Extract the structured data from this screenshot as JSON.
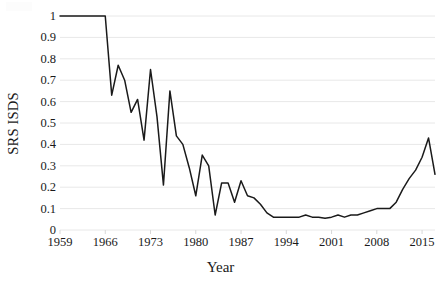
{
  "chart_data": {
    "type": "line",
    "title": "",
    "xlabel": "Year",
    "ylabel": "SRS ISDS",
    "xlim": [
      1959,
      2017
    ],
    "ylim": [
      0,
      1
    ],
    "grid": true,
    "legend": false,
    "line_color": "#1a1a1a",
    "gridline_color": "#e8e8e8",
    "ytick_labels": [
      "1",
      "0.9",
      "0.8",
      "0.7",
      "0.6",
      "0.5",
      "0.4",
      "0.3",
      "0.2",
      "0.1",
      "0"
    ],
    "ytick_values": [
      1,
      0.9,
      0.8,
      0.7,
      0.6,
      0.5,
      0.4,
      0.3,
      0.2,
      0.1,
      0
    ],
    "xtick_labels": [
      "1959",
      "1966",
      "1973",
      "1980",
      "1987",
      "1994",
      "2001",
      "2008",
      "2015"
    ],
    "xtick_values": [
      1959,
      1966,
      1973,
      1980,
      1987,
      1994,
      2001,
      2008,
      2015
    ],
    "x": [
      1959,
      1960,
      1961,
      1962,
      1963,
      1964,
      1965,
      1966,
      1967,
      1968,
      1969,
      1970,
      1971,
      1972,
      1973,
      1974,
      1975,
      1976,
      1977,
      1978,
      1979,
      1980,
      1981,
      1982,
      1983,
      1984,
      1985,
      1986,
      1987,
      1988,
      1989,
      1990,
      1991,
      1992,
      1993,
      1994,
      1995,
      1996,
      1997,
      1998,
      1999,
      2000,
      2001,
      2002,
      2003,
      2004,
      2005,
      2006,
      2007,
      2008,
      2009,
      2010,
      2011,
      2012,
      2013,
      2014,
      2015,
      2016,
      2017
    ],
    "y": [
      1,
      1,
      1,
      1,
      1,
      1,
      1,
      1,
      0.63,
      0.77,
      0.7,
      0.55,
      0.61,
      0.42,
      0.75,
      0.53,
      0.21,
      0.65,
      0.44,
      0.4,
      0.29,
      0.16,
      0.35,
      0.3,
      0.07,
      0.22,
      0.22,
      0.13,
      0.23,
      0.16,
      0.15,
      0.12,
      0.08,
      0.06,
      0.06,
      0.06,
      0.06,
      0.06,
      0.07,
      0.06,
      0.06,
      0.055,
      0.06,
      0.07,
      0.06,
      0.07,
      0.07,
      0.08,
      0.09,
      0.1,
      0.1,
      0.1,
      0.13,
      0.19,
      0.24,
      0.28,
      0.34,
      0.43,
      0.26
    ],
    "series": [
      {
        "name": "SRS ISDS",
        "values": [
          1,
          1,
          1,
          1,
          1,
          1,
          1,
          1,
          0.63,
          0.77,
          0.7,
          0.55,
          0.61,
          0.42,
          0.75,
          0.53,
          0.21,
          0.65,
          0.44,
          0.4,
          0.29,
          0.16,
          0.35,
          0.3,
          0.07,
          0.22,
          0.22,
          0.13,
          0.23,
          0.16,
          0.15,
          0.12,
          0.08,
          0.06,
          0.06,
          0.06,
          0.06,
          0.06,
          0.07,
          0.06,
          0.06,
          0.055,
          0.06,
          0.07,
          0.06,
          0.07,
          0.07,
          0.08,
          0.09,
          0.1,
          0.1,
          0.1,
          0.13,
          0.19,
          0.24,
          0.28,
          0.34,
          0.43,
          0.26
        ]
      }
    ]
  }
}
